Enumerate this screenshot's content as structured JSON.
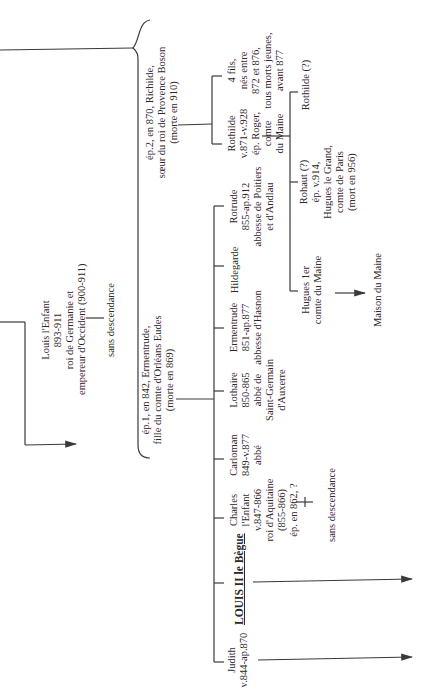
{
  "tree": {
    "louis_enfant": {
      "lines": [
        "Louis l'Enfant",
        "893-911",
        "roi de Germanie et",
        "empereur d'Occident (900-911)"
      ]
    },
    "louis_enfant_note": "sans descendance",
    "spouse2": {
      "lines": [
        "ép.2, en 870, Richilde,",
        "sœur du roi de Provence Boson",
        "(morte en 910)"
      ]
    },
    "spouse1": {
      "lines": [
        "ép.1, en 842, Ermentrude,",
        "fille du comte d'Orléans Eudes",
        "(morte en 869)"
      ]
    },
    "children_spouse2": [
      {
        "name": "rothilde",
        "lines": [
          "Rothilde",
          "v.871-v.928",
          "ép. Roger,",
          "comte",
          "du Maine"
        ]
      },
      {
        "name": "quatre-fils",
        "lines": [
          "4 fils,",
          "nés entre",
          "872 et 876,",
          "tous morts jeunes,",
          "avant 877"
        ]
      }
    ],
    "rothilde_children": [
      {
        "name": "hugues",
        "lines": [
          "Hugues 1er",
          "comte du Maine"
        ]
      },
      {
        "name": "rohaut",
        "lines": [
          "Rohaut (?)",
          "ép. v.914,",
          "Hugues le Grand,",
          "comte de Paris",
          "(mort en 956)"
        ]
      },
      {
        "name": "rothilde-2",
        "lines": [
          "Rothilde (?)"
        ]
      }
    ],
    "hugues_descendant": "Maison du Maine",
    "children_spouse1": [
      {
        "name": "judith",
        "lines": [
          "Judith",
          "v.844-ap.870"
        ]
      },
      {
        "name": "louis-ii",
        "lines": [
          "LOUIS II le Bègue"
        ]
      },
      {
        "name": "charles",
        "lines": [
          "Charles",
          "l'Enfant",
          "v.847-866",
          "roi d'Aquitaine",
          "(855-866)",
          "ép. en 862, ?"
        ]
      },
      {
        "name": "carloman",
        "lines": [
          "Carloman",
          "849-v.877",
          "abbé"
        ]
      },
      {
        "name": "lothaire",
        "lines": [
          "Lothaire",
          "850-865",
          "abbé de",
          "Saint-Germain",
          "d'Auxerre"
        ]
      },
      {
        "name": "ermentrude",
        "lines": [
          "Ermentrude",
          "851-ap.877",
          "abbesse d'Hasnon"
        ]
      },
      {
        "name": "hildegarde",
        "lines": [
          "Hildegarde"
        ]
      },
      {
        "name": "rotrude",
        "lines": [
          "Rotrude",
          "855-ap.912",
          "abbesse de Poitiers",
          "et d'Andlau"
        ]
      }
    ],
    "charles_note": "sans descendance"
  },
  "colors": {
    "line": "#3a3a3a",
    "text": "#2a2a2a",
    "background": "#ffffff"
  }
}
